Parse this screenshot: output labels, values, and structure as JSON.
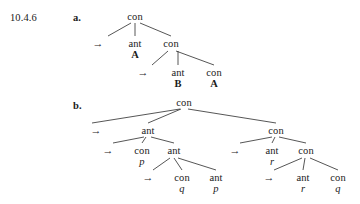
{
  "exercise": {
    "number": "10.4.6"
  },
  "parts": [
    {
      "label": "a.",
      "nodes": [
        {
          "name": "a-root",
          "text": "con",
          "kind": "node",
          "x": 135,
          "y": 11
        },
        {
          "name": "a-l1-ant",
          "text": "ant",
          "kind": "node",
          "x": 135,
          "y": 38
        },
        {
          "name": "a-l1-ant-atom",
          "text": "A",
          "kind": "atom",
          "x": 135,
          "y": 49
        },
        {
          "name": "a-l1-con",
          "text": "con",
          "kind": "node",
          "x": 171,
          "y": 38
        },
        {
          "name": "a-l2-ant",
          "text": "ant",
          "kind": "node",
          "x": 178,
          "y": 67
        },
        {
          "name": "a-l2-ant-atom",
          "text": "B",
          "kind": "atom",
          "x": 178,
          "y": 78
        },
        {
          "name": "a-l2-con",
          "text": "con",
          "kind": "node",
          "x": 214,
          "y": 67
        },
        {
          "name": "a-l2-con-atom",
          "text": "A",
          "kind": "atom",
          "x": 214,
          "y": 78
        }
      ],
      "arrows": [
        {
          "name": "a-arrow-1",
          "text": "→",
          "x": 98,
          "y": 38
        },
        {
          "name": "a-arrow-2",
          "text": "→",
          "x": 143,
          "y": 67
        }
      ],
      "edges": [
        {
          "name": "a-edge-root-ant",
          "x1": 135,
          "y1": 23,
          "x2": 135,
          "y2": 36
        },
        {
          "name": "a-edge-root-left",
          "x1": 131,
          "y1": 23,
          "x2": 108,
          "y2": 36
        },
        {
          "name": "a-edge-root-con",
          "x1": 140,
          "y1": 23,
          "x2": 171,
          "y2": 36
        },
        {
          "name": "a-edge-con-ant",
          "x1": 178,
          "y1": 51,
          "x2": 178,
          "y2": 65
        },
        {
          "name": "a-edge-con-left",
          "x1": 168,
          "y1": 51,
          "x2": 152,
          "y2": 65
        },
        {
          "name": "a-edge-con-con",
          "x1": 176,
          "y1": 51,
          "x2": 214,
          "y2": 65
        }
      ]
    },
    {
      "label": "b.",
      "nodes": [
        {
          "name": "b-root",
          "text": "con",
          "kind": "node",
          "x": 184,
          "y": 97
        },
        {
          "name": "b-l1-ant",
          "text": "ant",
          "kind": "node",
          "x": 148,
          "y": 125
        },
        {
          "name": "b-l1-con",
          "text": "con",
          "kind": "node",
          "x": 276,
          "y": 125
        },
        {
          "name": "b-l2-left-con",
          "text": "con",
          "kind": "node",
          "x": 142,
          "y": 145
        },
        {
          "name": "b-l2-left-con-var",
          "text": "p",
          "kind": "var",
          "x": 142,
          "y": 156
        },
        {
          "name": "b-l2-left-ant",
          "text": "ant",
          "kind": "node",
          "x": 174,
          "y": 145
        },
        {
          "name": "b-l2-right-ant",
          "text": "ant",
          "kind": "node",
          "x": 272,
          "y": 145
        },
        {
          "name": "b-l2-right-ant-var",
          "text": "r",
          "kind": "var",
          "x": 272,
          "y": 156
        },
        {
          "name": "b-l2-right-con",
          "text": "con",
          "kind": "node",
          "x": 306,
          "y": 145
        },
        {
          "name": "b-l3-left-con",
          "text": "con",
          "kind": "node",
          "x": 182,
          "y": 172
        },
        {
          "name": "b-l3-left-con-var",
          "text": "q",
          "kind": "var",
          "x": 182,
          "y": 183
        },
        {
          "name": "b-l3-left-ant",
          "text": "ant",
          "kind": "node",
          "x": 216,
          "y": 172
        },
        {
          "name": "b-l3-left-ant-var",
          "text": "p",
          "kind": "var",
          "x": 216,
          "y": 183
        },
        {
          "name": "b-l3-right-ant",
          "text": "ant",
          "kind": "node",
          "x": 303,
          "y": 172
        },
        {
          "name": "b-l3-right-ant-var",
          "text": "r",
          "kind": "var",
          "x": 303,
          "y": 183
        },
        {
          "name": "b-l3-right-con",
          "text": "con",
          "kind": "node",
          "x": 338,
          "y": 172
        },
        {
          "name": "b-l3-right-con-var",
          "text": "q",
          "kind": "var",
          "x": 338,
          "y": 183
        }
      ],
      "arrows": [
        {
          "name": "b-arrow-1",
          "text": "→",
          "x": 96,
          "y": 125
        },
        {
          "name": "b-arrow-2",
          "text": "→",
          "x": 108,
          "y": 145
        },
        {
          "name": "b-arrow-3",
          "text": "→",
          "x": 235,
          "y": 145
        },
        {
          "name": "b-arrow-4",
          "text": "→",
          "x": 148,
          "y": 172
        },
        {
          "name": "b-arrow-5",
          "text": "→",
          "x": 269,
          "y": 172
        }
      ],
      "edges": [
        {
          "name": "b-edge-root-left",
          "x1": 180,
          "y1": 109,
          "x2": 92,
          "y2": 123
        },
        {
          "name": "b-edge-root-ant",
          "x1": 181,
          "y1": 109,
          "x2": 148,
          "y2": 123
        },
        {
          "name": "b-edge-root-con",
          "x1": 188,
          "y1": 109,
          "x2": 276,
          "y2": 123
        },
        {
          "name": "b-edge-ant-left",
          "x1": 144,
          "y1": 137,
          "x2": 113,
          "y2": 143
        },
        {
          "name": "b-edge-ant-con",
          "x1": 146,
          "y1": 137,
          "x2": 142,
          "y2": 143
        },
        {
          "name": "b-edge-ant-ant",
          "x1": 151,
          "y1": 137,
          "x2": 174,
          "y2": 143
        },
        {
          "name": "b-edge-rcon-left",
          "x1": 272,
          "y1": 137,
          "x2": 240,
          "y2": 143
        },
        {
          "name": "b-edge-rcon-ant",
          "x1": 275,
          "y1": 137,
          "x2": 272,
          "y2": 143
        },
        {
          "name": "b-edge-rcon-con",
          "x1": 279,
          "y1": 137,
          "x2": 306,
          "y2": 143
        },
        {
          "name": "b-edge-lant-left",
          "x1": 170,
          "y1": 158,
          "x2": 153,
          "y2": 170
        },
        {
          "name": "b-edge-lant-con",
          "x1": 174,
          "y1": 158,
          "x2": 182,
          "y2": 170
        },
        {
          "name": "b-edge-lant-ant",
          "x1": 178,
          "y1": 158,
          "x2": 216,
          "y2": 170
        },
        {
          "name": "b-edge-rcon2-left",
          "x1": 302,
          "y1": 158,
          "x2": 274,
          "y2": 170
        },
        {
          "name": "b-edge-rcon2-ant",
          "x1": 305,
          "y1": 158,
          "x2": 303,
          "y2": 170
        },
        {
          "name": "b-edge-rcon2-con",
          "x1": 310,
          "y1": 158,
          "x2": 338,
          "y2": 170
        }
      ]
    }
  ],
  "colors": {
    "background": "#ffffff",
    "text": "#1a1a1a",
    "line": "#2b2b2b"
  }
}
